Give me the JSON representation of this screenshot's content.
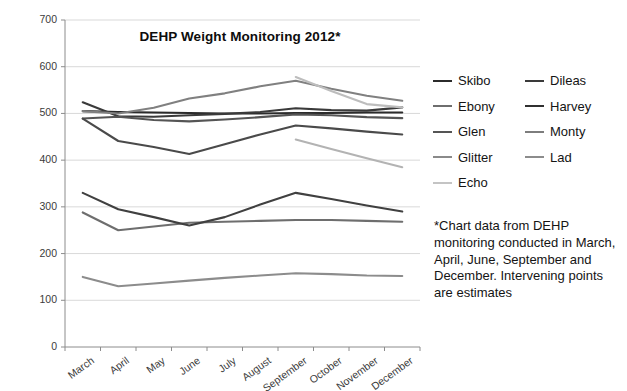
{
  "chart_data": {
    "type": "line",
    "title": "DEHP Weight Monitoring 2012*",
    "xlabel": "",
    "ylabel": "",
    "ylim": [
      0,
      700
    ],
    "ytick_step": 100,
    "yticks": [
      0,
      100,
      200,
      300,
      400,
      500,
      600,
      700
    ],
    "grid": true,
    "legend_position": "right",
    "categories": [
      "March",
      "April",
      "May",
      "June",
      "July",
      "August",
      "September",
      "October",
      "November",
      "December"
    ],
    "series": [
      {
        "name": "Skibo",
        "color": "#2b2b2b",
        "values": [
          505,
          503,
          502,
          501,
          500,
          500,
          501,
          501,
          502,
          502
        ]
      },
      {
        "name": "Dileas",
        "color": "#3a3a3a",
        "values": [
          524,
          494,
          493,
          496,
          499,
          503,
          511,
          507,
          506,
          513
        ]
      },
      {
        "name": "Ebony",
        "color": "#6e6e6e",
        "values": [
          288,
          250,
          258,
          266,
          268,
          270,
          272,
          272,
          270,
          268
        ]
      },
      {
        "name": "Harvey",
        "color": "#404040",
        "values": [
          330,
          295,
          278,
          260,
          278,
          305,
          330,
          317,
          303,
          290
        ]
      },
      {
        "name": "Glen",
        "color": "#555555",
        "values": [
          489,
          493,
          486,
          483,
          487,
          492,
          498,
          496,
          492,
          490
        ]
      },
      {
        "name": "Monty",
        "color": "#808080",
        "values": [
          505,
          500,
          512,
          532,
          543,
          558,
          570,
          553,
          538,
          527
        ]
      },
      {
        "name": "Glitter",
        "color": "#4a4a4a",
        "values": [
          489,
          441,
          428,
          413,
          434,
          455,
          474,
          468,
          461,
          455
        ]
      },
      {
        "name": "Lad",
        "color": "#8c8c8c",
        "values": [
          150,
          130,
          136,
          142,
          148,
          153,
          158,
          156,
          153,
          152
        ]
      },
      {
        "name": "Echo",
        "color": "#bdbdbd",
        "values": [
          null,
          null,
          null,
          null,
          null,
          null,
          578,
          548,
          520,
          513
        ]
      },
      {
        "name": "Echo-lower",
        "color": "#b3b3b3",
        "values": [
          null,
          null,
          null,
          null,
          null,
          null,
          444,
          424,
          404,
          385
        ],
        "hide_from_legend": true
      }
    ]
  },
  "legend": {
    "columns": [
      {
        "items": [
          {
            "label": "Skibo",
            "color": "#2b2b2b"
          },
          {
            "label": "Ebony",
            "color": "#6e6e6e"
          },
          {
            "label": "Glen",
            "color": "#555555"
          },
          {
            "label": "Glitter",
            "color": "#8a8a8a"
          },
          {
            "label": "Echo",
            "color": "#c4c4c4"
          }
        ]
      },
      {
        "items": [
          {
            "label": "Dileas",
            "color": "#3a3a3a"
          },
          {
            "label": "Harvey",
            "color": "#303030"
          },
          {
            "label": "Monty",
            "color": "#7d7d7d"
          },
          {
            "label": "Lad",
            "color": "#8c8c8c"
          }
        ]
      }
    ]
  },
  "footnote": {
    "text": "*Chart data from DEHP monitoring conducted in March, April, June, September and December. Intervening points are estimates"
  }
}
